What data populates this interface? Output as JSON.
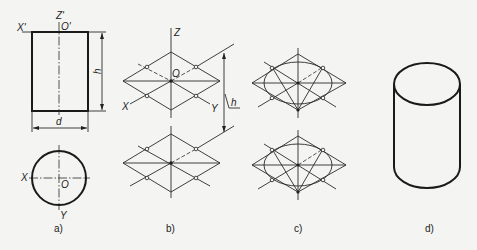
{
  "figure": {
    "panels": [
      {
        "id": "a",
        "caption": "a)",
        "labels": {
          "x_top": "X'",
          "z_top": "Z'",
          "o_top": "O'",
          "height": "h",
          "diameter": "d",
          "x_bottom": "X",
          "y_bottom": "Y",
          "o_bottom": "O"
        }
      },
      {
        "id": "b",
        "caption": "b)",
        "labels": {
          "z": "Z",
          "o": "O",
          "x": "X",
          "y": "Y",
          "height": "h"
        }
      },
      {
        "id": "c",
        "caption": "c)"
      },
      {
        "id": "d",
        "caption": "d)"
      }
    ]
  },
  "colors": {
    "line": "#1a1a1a",
    "background": "#f4f4f2"
  }
}
